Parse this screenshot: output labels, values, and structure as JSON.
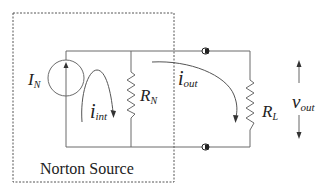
{
  "diagram": {
    "title": "Norton Source",
    "components": {
      "source": {
        "label": "I",
        "subscript": "N"
      },
      "internal_resistor": {
        "label": "R",
        "subscript": "N"
      },
      "load_resistor": {
        "label": "R",
        "subscript": "L"
      }
    },
    "currents": {
      "internal": {
        "label": "i",
        "subscript": "int"
      },
      "output": {
        "label": "i",
        "subscript": "out"
      }
    },
    "voltage": {
      "label": "v",
      "subscript": "out"
    },
    "colors": {
      "line": "#6b6b6b",
      "text": "#222222",
      "terminal": "#222222"
    }
  }
}
